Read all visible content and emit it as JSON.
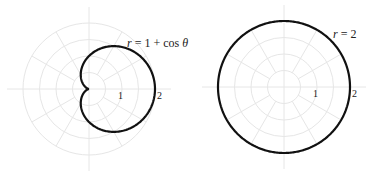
{
  "figures": [
    {
      "id": "cardioid",
      "equation_label": "r = 1 + cos θ",
      "equation_parts": {
        "r": "r",
        "eq": "= 1 + cos",
        "theta": "θ"
      },
      "tick_labels": [
        "1",
        "2"
      ],
      "center": [
        89,
        89
      ],
      "unit_px": 33,
      "grid_radii": [
        0.5,
        1,
        1.5,
        2
      ],
      "grid_spokes_deg": 30,
      "curve": "r = 1 + cos(theta)"
    },
    {
      "id": "circle",
      "equation_label": "r = 2",
      "equation_parts": {
        "r": "r",
        "eq": "= 2"
      },
      "tick_labels": [
        "1",
        "2"
      ],
      "center": [
        284,
        87
      ],
      "unit_px": 33,
      "grid_radii": [
        0.5,
        1,
        1.5,
        2
      ],
      "grid_spokes_deg": 30,
      "curve": "r = 2"
    }
  ],
  "colors": {
    "grid": "#e6e6e6",
    "curve": "#111111",
    "text": "#222222"
  }
}
